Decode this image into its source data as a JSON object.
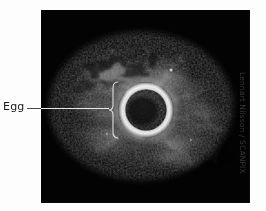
{
  "figure": {
    "type": "photomicrograph",
    "background_color": "#fdfdfd",
    "plate_color": "#030303"
  },
  "annotations": {
    "label": "Egg",
    "leader_line": {
      "name": "leader-line",
      "color": "#e8e8e6"
    },
    "brace": {
      "name": "curly-brace",
      "color": "#dedede",
      "orientation": "points-left"
    }
  },
  "credit": {
    "text": "Lennart Nilsson / SCANPIX",
    "orientation": "vertical-rotated-90",
    "color": "#3a3a3a"
  },
  "colors": {
    "background": "#fdfdfd",
    "plate": "#030303",
    "label_text": "#1c1c1c",
    "annotation_stroke": "#e8e8e6",
    "credit_text": "#3a3a3a",
    "cloud_bright": "#b9b9b9",
    "cloud_mid": "#6e6e6e",
    "cloud_dim": "#323232",
    "zona_bright": "#f2f2f2",
    "ooplasm_dark": "#0f0f0f"
  },
  "geometry": {
    "plate": {
      "x": 41,
      "y": 10,
      "w": 209,
      "h": 193
    },
    "egg": {
      "cx": 146,
      "cy": 110,
      "outer_r": 28,
      "inner_r": 20
    },
    "brace": {
      "x": 113,
      "y_top": 82,
      "y_bottom": 136
    },
    "leader": {
      "x1": 27,
      "x2": 113,
      "y": 108
    }
  }
}
